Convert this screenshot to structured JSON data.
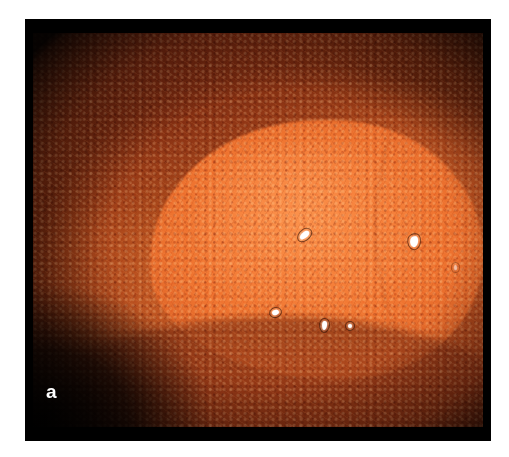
{
  "figure": {
    "panel_label": "a",
    "modality": "endoscopic-photograph"
  },
  "frame": {
    "border_color": "#000000",
    "background_color": "#ffffff",
    "left": 25,
    "top": 19,
    "width": 466,
    "height": 422
  },
  "image_region": {
    "left": 8,
    "top": 14,
    "width": 450,
    "height": 394
  },
  "colors": {
    "lesion_bright_orange": "#F4803C",
    "lesion_apex": "#F8843C",
    "mucosa_mid_orange": "#CF6328",
    "mucosa_dark_brown": "#8E3A18",
    "mucosa_deep_shadow": "#601E0A",
    "specular_white": "#FFFFFF",
    "frame_black": "#000000",
    "page_white": "#FFFFFF",
    "label_white": "#FFFFFF"
  },
  "features": {
    "raised_lesion": "central elevated plaque occupying right-of-centre field",
    "upper_fold": "darker shadowed mucosal fold across upper-left quadrant",
    "lower_fold": "shadowed mucosal fold running across the lower third",
    "right_ridge": "faint curved mucosal ridge near the right margin",
    "surface_pattern": "granular pit pattern over the lesion surface",
    "vignette": "circumferential endoscope vignette darkening toward the corners"
  },
  "specular_highlights": [
    {
      "id": "specular-1",
      "x_pct": 59.2,
      "y_pct": 50.6,
      "w": 11,
      "h": 6,
      "rotation_deg": -34
    },
    {
      "id": "specular-2",
      "x_pct": 83.8,
      "y_pct": 51.4,
      "w": 8,
      "h": 11,
      "rotation_deg": 14
    },
    {
      "id": "specular-3",
      "x_pct": 53.0,
      "y_pct": 70.2,
      "w": 7,
      "h": 5,
      "rotation_deg": -18
    },
    {
      "id": "specular-4",
      "x_pct": 64.2,
      "y_pct": 73.0,
      "w": 5,
      "h": 9,
      "rotation_deg": 6
    },
    {
      "id": "specular-5",
      "x_pct": 70.0,
      "y_pct": 73.8,
      "w": 4,
      "h": 4,
      "rotation_deg": 0
    },
    {
      "id": "specular-6",
      "x_pct": 93.6,
      "y_pct": 59.0,
      "w": 3,
      "h": 5,
      "rotation_deg": 0
    }
  ]
}
